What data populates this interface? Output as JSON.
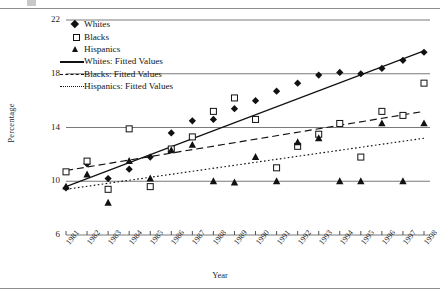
{
  "figure": {
    "top_glyph": "cropped-text-fragment",
    "x_axis_title": "Year",
    "y_axis_title": "Percentage"
  },
  "chart_data": {
    "type": "scatter",
    "title": "",
    "xlabel": "Year",
    "ylabel": "Percentage",
    "xlim": [
      1981,
      1998
    ],
    "ylim": [
      6,
      22
    ],
    "yticks": [
      6,
      10,
      14,
      18,
      22
    ],
    "grid": "horizontal",
    "legend_position": "top-left-inside",
    "x": [
      1981,
      1982,
      1983,
      1984,
      1985,
      1986,
      1987,
      1988,
      1989,
      1990,
      1991,
      1992,
      1993,
      1994,
      1995,
      1996,
      1997,
      1998
    ],
    "categories": [
      "1981",
      "1982",
      "1983",
      "1984",
      "1985",
      "1986",
      "1987",
      "1988",
      "1989",
      "1990",
      "1991",
      "1992",
      "1993",
      "1994",
      "1995",
      "1996",
      "1997",
      "1998"
    ],
    "series": [
      {
        "name": "Whites",
        "marker": "filled-diamond",
        "values": [
          9.5,
          11.3,
          10.2,
          10.9,
          11.8,
          13.6,
          14.5,
          14.6,
          15.4,
          16.0,
          16.7,
          17.3,
          17.9,
          18.1,
          18.0,
          18.4,
          19.0,
          19.6
        ]
      },
      {
        "name": "Blacks",
        "marker": "open-square",
        "values": [
          10.7,
          11.5,
          9.4,
          13.9,
          9.6,
          12.4,
          13.3,
          15.2,
          16.2,
          14.6,
          11.0,
          12.6,
          13.5,
          14.3,
          11.8,
          15.2,
          14.9,
          17.3
        ]
      },
      {
        "name": "Hispanics",
        "marker": "filled-triangle",
        "values": [
          9.6,
          10.5,
          8.4,
          11.5,
          10.2,
          12.3,
          12.7,
          10.0,
          9.9,
          11.8,
          10.0,
          12.9,
          13.2,
          10.0,
          10.0,
          14.3,
          10.0,
          14.3
        ]
      }
    ],
    "fits": [
      {
        "name": "Whites: Fitted Values",
        "style": "solid",
        "endpoints": [
          {
            "x": 1981,
            "y": 9.6
          },
          {
            "x": 1998,
            "y": 19.7
          }
        ]
      },
      {
        "name": "Blacks: Fitted Values",
        "style": "dashed",
        "endpoints": [
          {
            "x": 1981,
            "y": 10.8
          },
          {
            "x": 1998,
            "y": 15.2
          }
        ]
      },
      {
        "name": "Hispanics: Fitted Values",
        "style": "dotted",
        "endpoints": [
          {
            "x": 1981,
            "y": 9.4
          },
          {
            "x": 1998,
            "y": 13.2
          }
        ]
      }
    ]
  },
  "legend": {
    "items": [
      {
        "label": "Whites",
        "symbol": "filled-diamond"
      },
      {
        "label": "Blacks",
        "symbol": "open-square"
      },
      {
        "label": "Hispanics",
        "symbol": "filled-triangle"
      },
      {
        "label": "Whites: Fitted Values",
        "symbol": "solid-line"
      },
      {
        "label": "Blacks: Fitted Values",
        "symbol": "dashed-line"
      },
      {
        "label": "Hispanics: Fitted Values",
        "symbol": "dotted-line"
      }
    ]
  },
  "colors": {
    "ink": "#111111",
    "grid": "#7a7a7a",
    "rule": "#8d8d8d",
    "background": "#ffffff"
  }
}
